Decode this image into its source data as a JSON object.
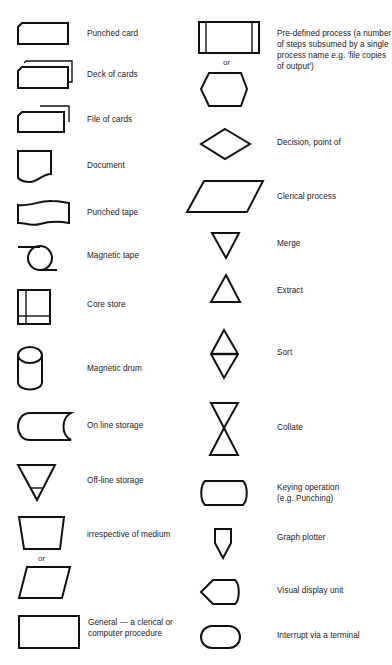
{
  "left_column": [
    {
      "id": "punched-card",
      "label": "Punched card"
    },
    {
      "id": "deck-of-cards",
      "label": "Deck of cards"
    },
    {
      "id": "file-of-cards",
      "label": "File of cards"
    },
    {
      "id": "document",
      "label": "Document"
    },
    {
      "id": "punched-tape",
      "label": "Punched tape"
    },
    {
      "id": "magnetic-tape",
      "label": "Magnetic tape"
    },
    {
      "id": "core-store",
      "label": "Core store"
    },
    {
      "id": "magnetic-drum",
      "label": "Magnetic drum"
    },
    {
      "id": "on-line-storage",
      "label": "On line storage"
    },
    {
      "id": "off-line-storage",
      "label": "Off-line storage"
    },
    {
      "id": "input-output",
      "label": "irrespective of medium",
      "alt_separator": "or"
    },
    {
      "id": "general-procedure",
      "label_line1": "General — a clerical or",
      "label_line2": "computer procedure"
    }
  ],
  "right_column": [
    {
      "id": "predefined-process",
      "label_lines": [
        "Pre-defined process (a number",
        "of steps subsumed by a single",
        "process name e.g. 'file copies",
        "of output')"
      ],
      "alt_separator": "or"
    },
    {
      "id": "decision",
      "label": "Decision, point of"
    },
    {
      "id": "clerical-process",
      "label": "Clerical process"
    },
    {
      "id": "merge",
      "label": "Merge"
    },
    {
      "id": "extract",
      "label": "Extract"
    },
    {
      "id": "sort",
      "label": "Sort"
    },
    {
      "id": "collate",
      "label": "Collate"
    },
    {
      "id": "keying-operation",
      "label_line1": "Keying operation",
      "label_line2": "(e.g. Punching)"
    },
    {
      "id": "graph-plotter",
      "label": "Graph plotter"
    },
    {
      "id": "visual-display-unit",
      "label": "Visual display unit"
    },
    {
      "id": "interrupt-terminal",
      "label": "Interrupt via a terminal"
    }
  ]
}
